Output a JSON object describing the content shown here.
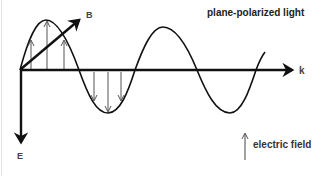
{
  "diagram": {
    "title": "plane-polarized light",
    "axes": {
      "propagation_label": "k",
      "magnetic_label": "B",
      "electric_label": "E"
    },
    "legend": {
      "icon": "up-arrow-icon",
      "label": "electric field"
    },
    "colors": {
      "stroke": "#111111",
      "field_arrows": "#555555",
      "text": "#333333"
    }
  }
}
